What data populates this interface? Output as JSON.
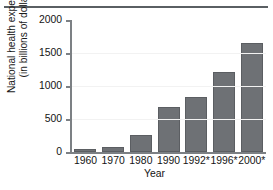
{
  "chart_data": {
    "type": "bar",
    "title": "",
    "subtitle": "",
    "xlabel": "Year",
    "ylabel_line1": "National health expenditure",
    "ylabel_line2": "(in billions of dollars)",
    "categories": [
      "1960",
      "1970",
      "1980",
      "1990",
      "1992*",
      "1996*",
      "2000*"
    ],
    "values": [
      45,
      75,
      260,
      680,
      840,
      1205,
      1650
    ],
    "ylim": [
      0,
      2000
    ],
    "yticks": [
      "0",
      "500",
      "1000",
      "1500",
      "2000"
    ],
    "ytick_values": [
      0,
      500,
      1000,
      1500,
      2000
    ],
    "grid": false,
    "legend": "none",
    "bar_color": "#6e7175",
    "bar_edge_color": "#5b5e62",
    "axis_color": "#7c8084",
    "text_color": "#141414",
    "top_rule_color": "#5a5f63",
    "note": "* projected"
  }
}
